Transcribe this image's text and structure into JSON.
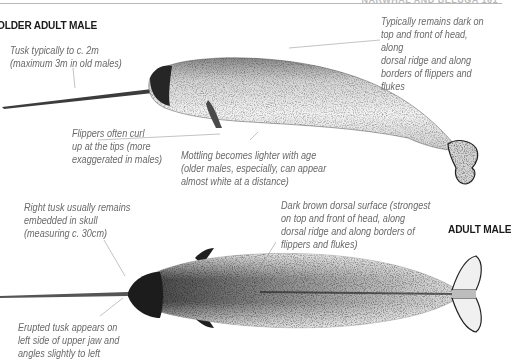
{
  "page": {
    "running_head": "NARWHAL AND BELUGA   161"
  },
  "sections": {
    "older_adult_male": {
      "title": "OLDER ADULT MALE",
      "notes": {
        "tusk": "Tusk typically to c. 2m\n(maximum 3m in old males)",
        "dark_areas": "Typically remains dark on\ntop and front of head, along\ndorsal ridge and along\nborders of flippers and flukes",
        "flippers": "Flippers often curl\nup at the tips (more\nexaggerated in males)",
        "mottling": "Mottling becomes lighter with age\n(older males, especially, can appear\nalmost white at a distance)"
      }
    },
    "adult_male": {
      "title": "ADULT MALE",
      "notes": {
        "right_tusk": "Right tusk usually remains\nembedded in skull\n(measuring c. 30cm)",
        "dorsal_surface": "Dark brown dorsal surface (strongest\non top and front of head, along\ndorsal ridge and along borders of\nflippers and flukes)",
        "erupted_tusk": "Erupted tusk appears on\nleft side of upper jaw and\nangles slightly to left"
      }
    }
  },
  "colors": {
    "title": "#1a1a1a",
    "note_text": "#6a6a6a",
    "leader_line": "#9a9a9a",
    "body_dark": "#2a2a2a",
    "body_light": "#f2f2f2"
  }
}
